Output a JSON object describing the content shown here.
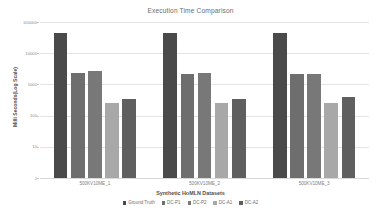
{
  "chart_data": {
    "type": "bar",
    "title": "Execution Time Comparison",
    "xlabel": "Synthetic HoMLN Datasets",
    "ylabel": "Milli Seconds(Log Scale)",
    "scale": "log",
    "grid": true,
    "legend_position": "bottom",
    "ylim": [
      1,
      100000
    ],
    "yticks": [
      1,
      10,
      100,
      1000,
      10000,
      100000
    ],
    "ytick_labels": [
      "1",
      "10",
      "100",
      "1000",
      "10000",
      "100000"
    ],
    "categories": [
      "500KV10ME_1",
      "500KV10ME_2",
      "500KV10ME_3"
    ],
    "series": [
      {
        "name": "Ground Truth",
        "color": "#4a4a4a",
        "values": [
          46000,
          46000,
          46000
        ]
      },
      {
        "name": "DC-P1",
        "color": "#6e6e6e",
        "values": [
          2400,
          2100,
          2100
        ]
      },
      {
        "name": "DC-P2",
        "color": "#787878",
        "values": [
          2600,
          2400,
          2150
        ]
      },
      {
        "name": "DC-A1",
        "color": "#a8a8a8",
        "values": [
          250,
          250,
          255
        ]
      },
      {
        "name": "DC-A2",
        "color": "#5f5f5f",
        "values": [
          330,
          330,
          390
        ]
      }
    ]
  }
}
